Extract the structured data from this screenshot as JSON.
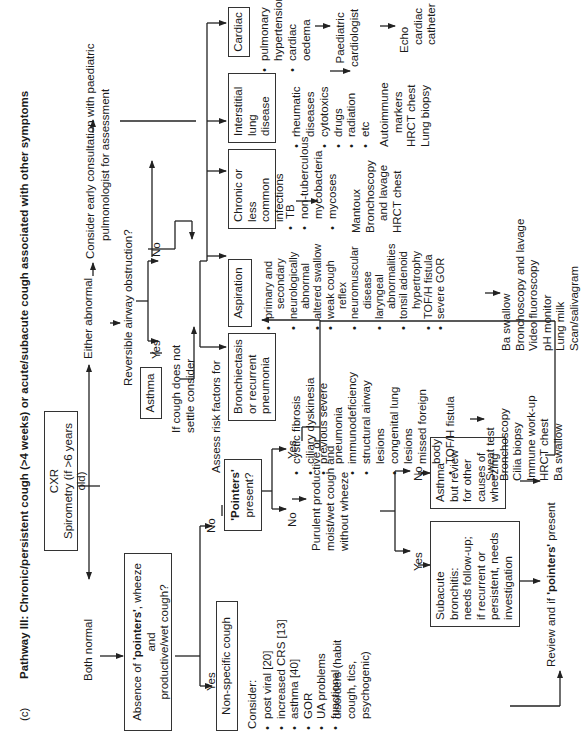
{
  "figure": {
    "label": "(c)",
    "title": "Pathway III: Chronic/persistent cough (>4 weeks) or acute/subacute cough associated with other symptoms"
  },
  "start": {
    "box_line1": "CXR",
    "box_line2": "Spirometry (if >6 years old)",
    "both_normal": "Both normal",
    "either_abnormal": "Either abnormal"
  },
  "consult": {
    "line1": "Consider early consultation with paediatric",
    "line2": "pulmonologist for assessment"
  },
  "reversible": {
    "question": "Reversible airway obstruction?",
    "yes": "Yes",
    "no": "No",
    "asthma": "Asthma",
    "if_not_settle_1": "If cough does not",
    "if_not_settle_2": "settle consider"
  },
  "assess": {
    "label": "Assess risk factors for"
  },
  "absence": {
    "line1_pre": "Absence of ",
    "line1_bold": "'pointers'",
    "line1_post": ", wheeze and",
    "line2": "productive/wet cough?",
    "yes": "Yes",
    "no": "No"
  },
  "nonspecific": {
    "box": "Non-specific cough",
    "consider": "Consider:",
    "items": [
      "post viral [20]",
      "increased CRS [13]",
      "asthma [40]",
      "GOR",
      "UA problems",
      "functional",
      "disorders (habit",
      "cough, tics,",
      "psychogenic)"
    ]
  },
  "pointers": {
    "line1": "'Pointers'",
    "line2": "present?",
    "yes": "Yes",
    "no": "No"
  },
  "purulent": {
    "line1": "Purulent productive or",
    "line2": "moist/wet cough and",
    "line3": "without wheeze",
    "yes": "Yes",
    "no": "No"
  },
  "subacute": {
    "lines": [
      "Subacute",
      "bronchitis:",
      "needs follow-up;",
      "if recurrent or",
      "persistent, needs",
      "investigation"
    ]
  },
  "asthma_review": {
    "lines": [
      "Asthma",
      "but review",
      "for other",
      "causes of",
      "wheezing"
    ]
  },
  "review": {
    "pre": "Review and if ",
    "bold": "'pointers'",
    "post": " present"
  },
  "categories": [
    {
      "name": "bronchiectasis",
      "box": [
        "Bronchiectasis",
        "or recurrent",
        "pneumonia"
      ],
      "risk_factors": [
        "cystic fibrosis",
        "ciliary dyskinesia",
        "previous severe",
        "pneumonia",
        "immunodeficiency",
        "structural airway",
        "lesions",
        "congenital lung",
        "lesions",
        "missed foreign",
        "body",
        "TOF/H fistula"
      ],
      "bullets": [
        0,
        1,
        2,
        4,
        5,
        7,
        9,
        11
      ],
      "tests": [
        "Sweat test",
        "Bronchoscopy",
        "Cilia biopsy",
        "Immune work-up",
        "HRCT chest",
        "Ba swallow"
      ]
    },
    {
      "name": "aspiration",
      "box": [
        "Aspiration"
      ],
      "risk_factors": [
        "primary and",
        "secondary",
        "neurologically",
        "abnormal",
        "altered swallow",
        "weak cough",
        "reflex",
        "neuromuscular",
        "disease",
        "laryngeal",
        "abnormalities",
        "tonsil adenoid",
        "hypertrophy",
        "TOF/H fistula",
        "severe GOR"
      ],
      "tests": [
        "Ba swallow",
        "Bronchoscopy and lavage",
        "Video fluoroscopy",
        "pH monitor",
        "Lung milk",
        "Scan/salivagram"
      ]
    },
    {
      "name": "chronic-infections",
      "box": [
        "Chronic or",
        "less common",
        "infections"
      ],
      "risk_factors": [
        "TB",
        "non-tuberculous",
        "mycobacteria",
        "mycoses"
      ],
      "tests": [
        "Mantoux",
        "Bronchoscopy",
        "and lavage",
        "HRCT chest"
      ]
    },
    {
      "name": "interstitial",
      "box": [
        "Interstitial",
        "lung",
        "disease"
      ],
      "risk_factors": [
        "rheumatic",
        "diseases",
        "cytotoxics",
        "drugs",
        "radiation",
        "etc"
      ],
      "tests": [
        "Autoimmune",
        "markers",
        "HRCT chest",
        "Lung biopsy"
      ]
    },
    {
      "name": "cardiac",
      "box": [
        "Cardiac"
      ],
      "risk_factors": [
        "pulmonary",
        "hypertension",
        "cardiac",
        "oedema"
      ],
      "referral": [
        "Paediatric",
        "cardiologist"
      ],
      "tests": [
        "Echo",
        "cardiac",
        "catheter"
      ]
    }
  ]
}
